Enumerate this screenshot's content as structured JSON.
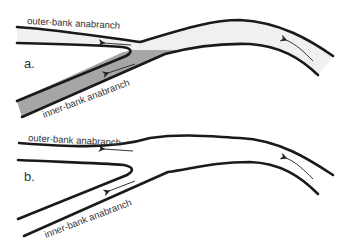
{
  "figure": {
    "type": "schematic river channel bifurcation diagram",
    "colors": {
      "bank_line": "#1a1a1a",
      "outer_channel_fill_a": "#f0f0f0",
      "inner_channel_fill_a": "#a6a6a6",
      "text": "#333333",
      "background": "#ffffff"
    },
    "panels": [
      {
        "id": "a",
        "label": "a.",
        "outer_branch_label": "outer-bank anabranch",
        "inner_branch_label": "inner-bank anabranch",
        "outer_branch_shaded": "light",
        "inner_branch_shaded": "dark",
        "flow_arrows": [
          "main-channel upstream arrow",
          "outer-branch leftward arrow",
          "inner-branch diagonal arrow"
        ]
      },
      {
        "id": "b",
        "label": "b.",
        "outer_branch_label": "outer-bank anabranch",
        "inner_branch_label": "inner-bank anabranch",
        "outer_branch_shaded": "none",
        "inner_branch_shaded": "none",
        "flow_arrows": [
          "main-channel upstream arrow",
          "outer-branch leftward arrow",
          "inner-branch diagonal arrow"
        ]
      }
    ]
  }
}
